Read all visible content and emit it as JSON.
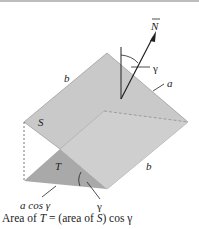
{
  "labels": {
    "normal": "N",
    "gamma_top": "γ",
    "a": "a",
    "b_top": "b",
    "b_right": "b",
    "S": "S",
    "T": "T",
    "a_cos_gamma": "a cos γ",
    "gamma_bottom": "γ"
  },
  "caption": {
    "part1": "Area of ",
    "T": "T",
    "part2": " = (area of ",
    "S": "S",
    "part3": ") cos γ"
  },
  "colors": {
    "plane": "#c8c8c8",
    "shadow": "#a9a9a9",
    "edge": "#9a9a9a",
    "ink": "#222222"
  }
}
